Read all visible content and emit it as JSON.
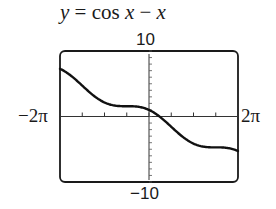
{
  "chart_data": {
    "type": "line",
    "title": "y = cos x − x",
    "xlabel": "",
    "ylabel": "",
    "xlim": [
      -6.2832,
      6.2832
    ],
    "ylim": [
      -10,
      10
    ],
    "x_tick_labels": {
      "min": "−2π",
      "max": "2π"
    },
    "y_tick_labels": {
      "min": "−10",
      "max": "10"
    },
    "x_tick_step": 1.5708,
    "y_tick_step": 1,
    "grid": false,
    "series": [
      {
        "name": "cos x − x",
        "function": "cos(x) - x",
        "x": [
          -6.2832,
          -4.7124,
          -3.1416,
          -1.5708,
          0,
          1.5708,
          3.1416,
          4.7124,
          6.2832
        ],
        "values": [
          7.28,
          4.71,
          2.14,
          1.57,
          1.0,
          -1.57,
          -4.14,
          -4.71,
          -5.28
        ]
      }
    ]
  },
  "title_parts": {
    "y": "y",
    "eq": " = cos ",
    "x1": "x",
    "minus": " − ",
    "x2": "x"
  },
  "labels": {
    "ymax": "10",
    "ymin": "−10",
    "xmin": "−2π",
    "xmax": "2π"
  }
}
